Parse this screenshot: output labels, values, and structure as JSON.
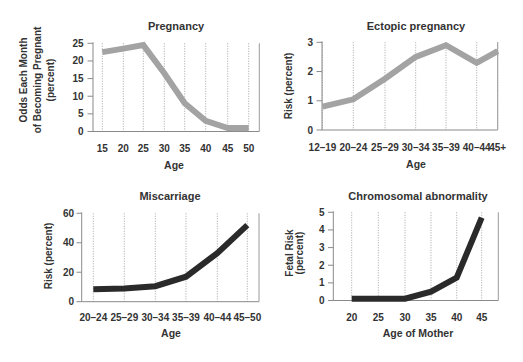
{
  "figure": {
    "panels": [
      "Pregnancy",
      "Ectopic pregnancy",
      "Miscarriage",
      "Chromosomal abnormality"
    ]
  },
  "chart_data": [
    {
      "type": "line",
      "title": "Pregnancy",
      "xlabel": "Age",
      "ylabel": "Odds Each Month of Becoming Pregnant (percent)",
      "ylabel_lines": [
        "Odds Each Month",
        "of Becoming Pregnant",
        "(percent)"
      ],
      "categories": [
        "15",
        "20",
        "25",
        "30",
        "35",
        "40",
        "45",
        "50"
      ],
      "values": [
        22.5,
        23.5,
        24.5,
        16.5,
        8,
        3,
        1,
        1
      ],
      "ylim": [
        0,
        25
      ],
      "yticks": [
        0,
        5,
        10,
        15,
        20,
        25
      ],
      "grid": true,
      "line_color": "#a3a3a3"
    },
    {
      "type": "line",
      "title": "Ectopic pregnancy",
      "xlabel": "Age",
      "ylabel": "Risk (percent)",
      "ylabel_lines": [
        "Risk (percent)"
      ],
      "categories": [
        "12–19",
        "20–24",
        "25–29",
        "30–34",
        "35–39",
        "40–44",
        "45+"
      ],
      "values": [
        0.8,
        1.05,
        1.75,
        2.5,
        2.9,
        2.3,
        2.7
      ],
      "ylim": [
        0,
        3
      ],
      "yticks": [
        0,
        1,
        2,
        3
      ],
      "grid": true,
      "line_color": "#a3a3a3"
    },
    {
      "type": "line",
      "title": "Miscarriage",
      "xlabel": "Age",
      "ylabel": "Risk (percent)",
      "ylabel_lines": [
        "Risk (percent)"
      ],
      "categories": [
        "20–24",
        "25–29",
        "30–34",
        "35–39",
        "40–44",
        "45–50"
      ],
      "values": [
        8.5,
        9,
        10.5,
        17,
        33,
        52
      ],
      "ylim": [
        0,
        60
      ],
      "yticks": [
        0,
        20,
        40,
        60
      ],
      "grid": true,
      "line_color": "#2b2b2b"
    },
    {
      "type": "line",
      "title": "Chromosomal abnormality",
      "xlabel": "Age of Mother",
      "ylabel": "Fetal Risk (percent)",
      "ylabel_lines": [
        "Fetal Risk",
        "(percent)"
      ],
      "categories": [
        "20",
        "25",
        "30",
        "35",
        "40",
        "45"
      ],
      "values": [
        0.1,
        0.1,
        0.1,
        0.5,
        1.3,
        4.7
      ],
      "ylim": [
        0,
        5
      ],
      "yticks": [
        0,
        1,
        2,
        3,
        4,
        5
      ],
      "grid": true,
      "line_color": "#2b2b2b"
    }
  ]
}
